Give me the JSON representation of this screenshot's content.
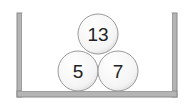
{
  "diagram": {
    "container": {
      "label": "container",
      "wall_color": "#8a8a8a",
      "wall_fill": "#b4b4b4"
    },
    "balls": [
      {
        "id": "top",
        "label": "13",
        "cx": 98,
        "cy": 33,
        "r": 20
      },
      {
        "id": "bottom-left",
        "label": "5",
        "cx": 78,
        "cy": 70,
        "r": 20
      },
      {
        "id": "bottom-right",
        "label": "7",
        "cx": 118,
        "cy": 70,
        "r": 20
      }
    ]
  }
}
